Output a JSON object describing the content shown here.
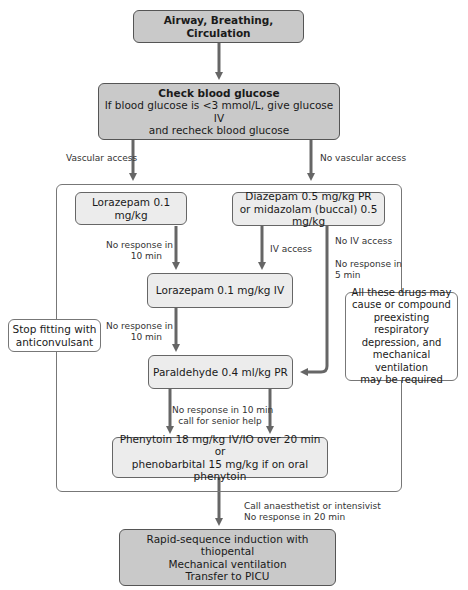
{
  "title_partial": "Figure: Management of status epilepticus (partially cropped)",
  "boxes": {
    "abc": {
      "text": "Airway, Breathing, Circulation"
    },
    "glucose": {
      "heading": "Check blood glucose",
      "line1": "If blood glucose is <3 mmol/L, give glucose IV",
      "line2": "and recheck blood glucose"
    },
    "lorazepam_first": {
      "text": "Lorazepam 0.1 mg/kg"
    },
    "diazepam": {
      "line1": "Diazepam 0.5 mg/kg PR",
      "line2": "or midazolam (buccal) 0.5 mg/kg"
    },
    "lorazepam_iv": {
      "text": "Lorazepam 0.1 mg/kg IV"
    },
    "paraldehyde": {
      "text": "Paraldehyde 0.4 ml/kg PR"
    },
    "phenytoin": {
      "line1": "Phenytoin 18 mg/kg IV/IO over 20 min or",
      "line2": "phenobarbital 15 mg/kg if on oral phenytoin"
    },
    "rsi": {
      "line1": "Rapid-sequence induction with thiopental",
      "line2": "Mechanical ventilation",
      "line3": "Transfer to PICU"
    },
    "stop_fitting": {
      "line1": "Stop fitting with",
      "line2": "anticonvulsant"
    },
    "warning_note": {
      "line1": "All these drugs may",
      "line2": "cause or compound",
      "line3": "preexisting respiratory",
      "line4": "depression, and",
      "line5": "mechanical ventilation",
      "line6": "may be required"
    }
  },
  "labels": {
    "vascular_access": "Vascular access",
    "no_vascular_access": "No vascular access",
    "no_response_10_a1": "No response in",
    "no_response_10_a2": "10 min",
    "iv_access": "IV access",
    "no_iv_access": "No IV access",
    "no_response_5_1": "No response in",
    "no_response_5_2": "5 min",
    "no_response_10_b1": "No response in",
    "no_response_10_b2": "10 min",
    "senior_help_1": "No response in 10 min",
    "senior_help_2": "call for senior help",
    "anaesthetist_1": "Call anaesthetist or intensivist",
    "anaesthetist_2": "No response in 20 min"
  },
  "colors": {
    "dark_box": "#c9c9c9",
    "light_box": "#ececec",
    "arrow": "#666666",
    "border": "#666666"
  }
}
